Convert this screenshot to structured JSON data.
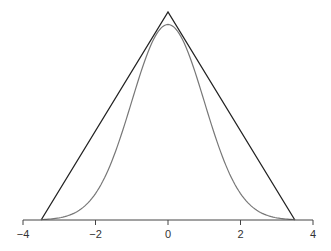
{
  "chart_data": {
    "type": "line",
    "title": "",
    "xlabel": "",
    "ylabel": "",
    "xlim": [
      -4,
      4
    ],
    "x_ticks": [
      -4,
      -2,
      0,
      2,
      4
    ],
    "x_tick_labels": [
      "−4",
      "−2",
      "0",
      "2",
      "4"
    ],
    "grid": false,
    "legend": null,
    "series": [
      {
        "name": "triangle",
        "color": "#222222",
        "x": [
          -3.5,
          0,
          3.5
        ],
        "y": [
          0,
          1.0,
          0
        ]
      },
      {
        "name": "gaussian",
        "color": "#777777",
        "description": "bell curve centered at 0, peak slightly below triangle apex",
        "mean": 0,
        "sd": 1.0,
        "peak": 0.94
      }
    ]
  }
}
